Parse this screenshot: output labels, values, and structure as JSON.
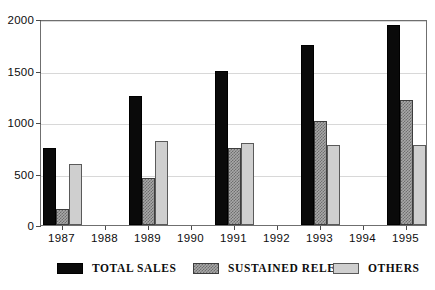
{
  "chart_data": {
    "type": "bar",
    "title": "",
    "subtitle": "",
    "xlabel": "",
    "ylabel": "",
    "ylim": [
      0,
      2000
    ],
    "yticks": [
      0,
      500,
      1000,
      1500,
      2000
    ],
    "ytick_labels": [
      "0",
      "500",
      "1000",
      "1500",
      "2000"
    ],
    "categories": [
      "1987",
      "1988",
      "1989",
      "1990",
      "1991",
      "1992",
      "1993",
      "1994",
      "1995"
    ],
    "xtick_labels": [
      "1987",
      "1988",
      "1989",
      "1990",
      "1991",
      "1992",
      "1993",
      "1994",
      "1995"
    ],
    "grid": true,
    "grid_axis": "y",
    "legend_position": "bottom",
    "series": [
      {
        "name": "TOTAL SALES",
        "color": "#0a0a0a",
        "pattern": "solid",
        "values": [
          745,
          null,
          1250,
          null,
          1500,
          null,
          1750,
          null,
          1940
        ]
      },
      {
        "name": "SUSTAINED RELEASE",
        "color": "#8f8f8f",
        "pattern": "checkered",
        "values": [
          155,
          null,
          455,
          null,
          750,
          null,
          1010,
          null,
          1210
        ]
      },
      {
        "name": "OTHERS",
        "color": "#cfcfcf",
        "pattern": "solid-light",
        "values": [
          590,
          null,
          820,
          null,
          800,
          null,
          775,
          null,
          775
        ]
      }
    ],
    "data_years": [
      "1987",
      "1989",
      "1991",
      "1993",
      "1995"
    ],
    "values_by_year": {
      "1987": {
        "TOTAL SALES": 745,
        "SUSTAINED RELEASE": 155,
        "OTHERS": 590
      },
      "1989": {
        "TOTAL SALES": 1250,
        "SUSTAINED RELEASE": 455,
        "OTHERS": 820
      },
      "1991": {
        "TOTAL SALES": 1500,
        "SUSTAINED RELEASE": 750,
        "OTHERS": 800
      },
      "1993": {
        "TOTAL SALES": 1750,
        "SUSTAINED RELEASE": 1010,
        "OTHERS": 775
      },
      "1995": {
        "TOTAL SALES": 1940,
        "SUSTAINED RELEASE": 1210,
        "OTHERS": 775
      }
    }
  },
  "legend": {
    "items": [
      {
        "label": "TOTAL SALES",
        "swatch": "black-solid-swatch"
      },
      {
        "label": "SUSTAINED RELEASE",
        "swatch": "gray-checkered-swatch"
      },
      {
        "label": "OTHERS",
        "swatch": "light-gray-swatch"
      }
    ]
  },
  "colors": {
    "total_sales": "#0a0a0a",
    "sustained_release": "#8f8f8f",
    "others": "#cfcfcf",
    "axis": "#6f6f6f",
    "grid": "#d8d8d8",
    "background": "#ffffff"
  }
}
